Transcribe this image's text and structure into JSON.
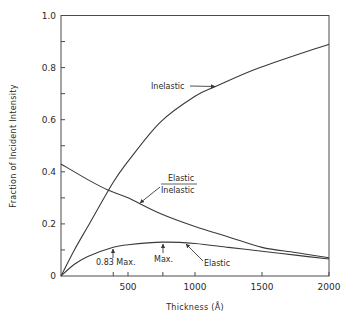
{
  "chart_data": {
    "type": "line",
    "title": "",
    "xlabel": "Thickness (Å)",
    "ylabel": "Fraction of Incident Intensity",
    "xlim": [
      0,
      2000
    ],
    "ylim": [
      0,
      1.0
    ],
    "grid": false,
    "x_ticks": [
      500,
      1000,
      1500,
      2000
    ],
    "x_tick_labels": [
      "500",
      "1000",
      "1500",
      "2000"
    ],
    "y_ticks": [
      0,
      0.2,
      0.4,
      0.6,
      0.8,
      1.0
    ],
    "y_tick_labels": [
      "0",
      "0.2",
      "0.4",
      "0.6",
      "0.8",
      "1.0"
    ],
    "series": [
      {
        "name": "Inelastic",
        "x": [
          0,
          100,
          200,
          390,
          500,
          740,
          1000,
          1165,
          1485,
          2000
        ],
        "values": [
          0,
          0.1,
          0.19,
          0.36,
          0.44,
          0.59,
          0.69,
          0.73,
          0.8,
          0.89
        ]
      },
      {
        "name": "Elastic/Inelastic",
        "x": [
          0,
          200,
          350,
          500,
          740,
          1000,
          1250,
          1500,
          1750,
          2000
        ],
        "values": [
          0.43,
          0.37,
          0.33,
          0.3,
          0.24,
          0.19,
          0.15,
          0.11,
          0.09,
          0.07
        ]
      },
      {
        "name": "Elastic",
        "x": [
          0,
          100,
          200,
          390,
          500,
          760,
          1000,
          1250,
          1500,
          1750,
          2000
        ],
        "values": [
          0,
          0.045,
          0.075,
          0.11,
          0.12,
          0.13,
          0.125,
          0.11,
          0.095,
          0.08,
          0.065
        ]
      }
    ],
    "annotations": [
      {
        "text": "Inelastic",
        "points_to": "Inelastic",
        "x": 1165,
        "y": 0.73
      },
      {
        "text": "Elastic / Inelastic",
        "points_to": "Elastic/Inelastic",
        "x": 740,
        "y": 0.24
      },
      {
        "text": "Elastic",
        "points_to": "Elastic",
        "x": 940,
        "y": 0.127
      },
      {
        "text": "0.83 Max.",
        "x": 390,
        "y": 0.11
      },
      {
        "text": "Max.",
        "x": 760,
        "y": 0.13
      }
    ]
  },
  "labels": {
    "xlabel_prefix": "Thickness (",
    "xlabel_unit": "Å",
    "xlabel_suffix": ")",
    "ylabel": "Fraction of Incident Intensity",
    "inelastic": "Inelastic",
    "ratio_top": "Elastic",
    "ratio_bottom": "Inelastic",
    "elastic": "Elastic",
    "max083": "0.83 Max.",
    "max": "Max."
  }
}
